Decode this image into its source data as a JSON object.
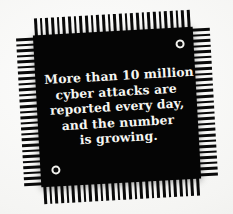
{
  "image": {
    "subject": "microchip-with-caption",
    "background_color": "#f4f4f2"
  },
  "chip": {
    "body_color": "#050505",
    "pin_color": "#0a0a0a",
    "text_color": "#f6f6f2",
    "rotation_degrees": -3.2,
    "pin_counts": {
      "top": 28,
      "bottom": 28,
      "left": 27,
      "right": 27
    },
    "alignment_dots": [
      {
        "name": "top-right",
        "position": "top-right"
      },
      {
        "name": "bottom-left",
        "position": "bottom-left"
      }
    ],
    "caption": {
      "lines": [
        "More than 10 million",
        "cyber attacks are",
        "reported every day,",
        "and the number",
        "is growing."
      ],
      "full_text": "More than 10 million cyber attacks are reported every day, and the number is growing."
    }
  }
}
